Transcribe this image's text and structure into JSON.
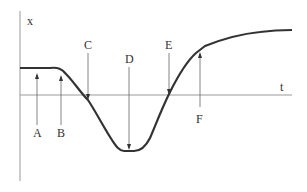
{
  "diagram": {
    "axes": {
      "y_label": "x",
      "x_label": "t"
    },
    "markers": [
      {
        "label": "A",
        "position": "below",
        "arrow": "up"
      },
      {
        "label": "B",
        "position": "below",
        "arrow": "up"
      },
      {
        "label": "C",
        "position": "above",
        "arrow": "down"
      },
      {
        "label": "D",
        "position": "above",
        "arrow": "down"
      },
      {
        "label": "E",
        "position": "above",
        "arrow": "down"
      },
      {
        "label": "F",
        "position": "below",
        "arrow": "up"
      }
    ],
    "colors": {
      "curve": "#333333",
      "axis": "#888888",
      "arrow": "#666666"
    }
  }
}
